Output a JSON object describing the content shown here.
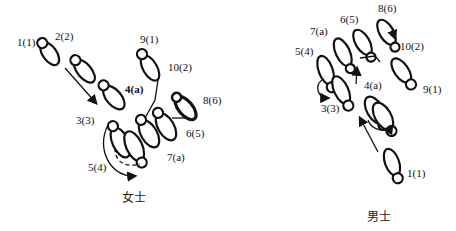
{
  "diagrams": [
    {
      "id": "woman",
      "caption": "女士",
      "labels": [
        {
          "text": "1(1)",
          "x": 17,
          "y": 37
        },
        {
          "text": "2(2)",
          "x": 55,
          "y": 31
        },
        {
          "text": "9(1)",
          "x": 140,
          "y": 34
        },
        {
          "text": "10(2)",
          "x": 168,
          "y": 62
        },
        {
          "text": "4(a)",
          "x": 125,
          "y": 84
        },
        {
          "text": "8(6)",
          "x": 203,
          "y": 95
        },
        {
          "text": "3(3)",
          "x": 76,
          "y": 115
        },
        {
          "text": "6(5)",
          "x": 186,
          "y": 128
        },
        {
          "text": "7(a)",
          "x": 167,
          "y": 152
        },
        {
          "text": "5(4)",
          "x": 88,
          "y": 162
        }
      ]
    },
    {
      "id": "man",
      "caption": "男士",
      "labels": [
        {
          "text": "8(6)",
          "x": 378,
          "y": 3
        },
        {
          "text": "6(5)",
          "x": 340,
          "y": 14
        },
        {
          "text": "7(a)",
          "x": 310,
          "y": 26
        },
        {
          "text": "10(2)",
          "x": 400,
          "y": 41
        },
        {
          "text": "5(4)",
          "x": 295,
          "y": 46
        },
        {
          "text": "4(a)",
          "x": 364,
          "y": 80
        },
        {
          "text": "9(1)",
          "x": 423,
          "y": 84
        },
        {
          "text": "3(3)",
          "x": 321,
          "y": 103
        },
        {
          "text": "1(1)",
          "x": 407,
          "y": 168
        }
      ]
    }
  ]
}
